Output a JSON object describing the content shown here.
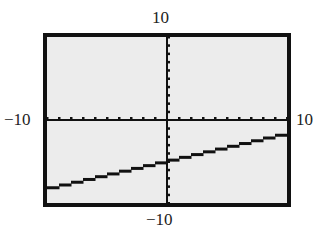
{
  "chart_data": {
    "type": "line",
    "title": "",
    "xlabel": "",
    "ylabel": "",
    "xlim": [
      -10,
      10
    ],
    "ylim": [
      -10,
      10
    ],
    "xscale": 1,
    "yscale": 1,
    "grid": false,
    "axis_labels": {
      "xmin": "−10",
      "xmax": "10",
      "ymin": "−10",
      "ymax": "10"
    },
    "series": [
      {
        "name": "y = x/3 − 5",
        "x": [
          -10,
          10
        ],
        "y": [
          -8.33,
          -1.67
        ]
      }
    ],
    "style": "graphing-calculator screen"
  },
  "colors": {
    "screen_bg": "#ececec",
    "frame": "#111111",
    "line": "#111111"
  }
}
